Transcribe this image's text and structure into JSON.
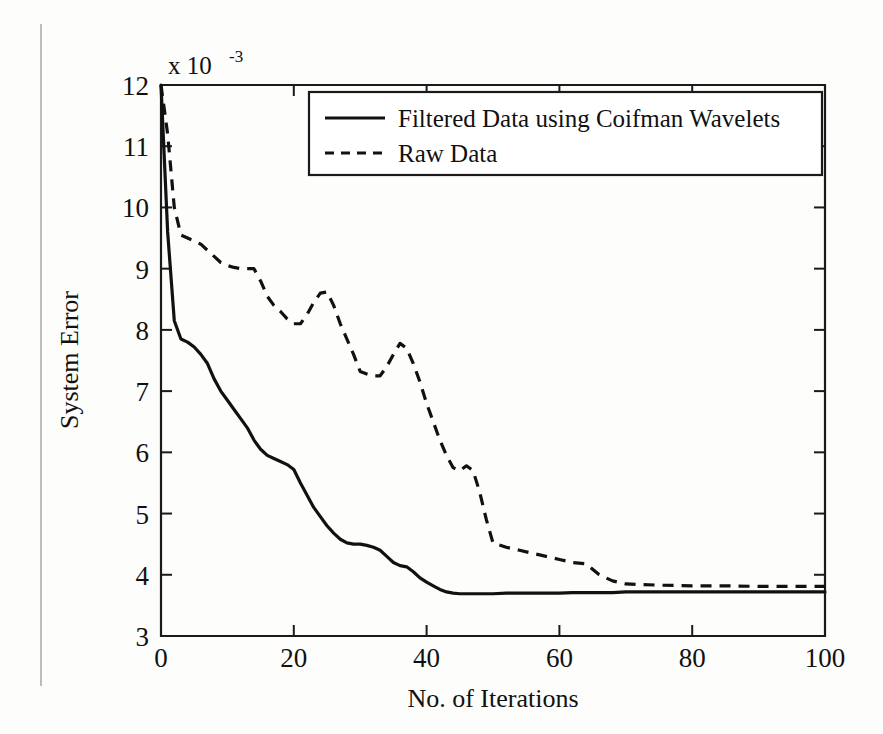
{
  "chart_data": {
    "type": "line",
    "title": "",
    "xlabel": "No. of Iterations",
    "ylabel": "System Error",
    "y_exponent_prefix": "x 10",
    "y_exponent_value": "-3",
    "xlim": [
      0,
      100
    ],
    "ylim": [
      3,
      12
    ],
    "xticks": [
      0,
      20,
      40,
      60,
      80,
      100
    ],
    "xticklabels": [
      "0",
      "20",
      "40",
      "60",
      "80",
      "100"
    ],
    "yticks": [
      3,
      4,
      5,
      6,
      7,
      8,
      9,
      10,
      11,
      12
    ],
    "yticklabels": [
      "3",
      "4",
      "5",
      "6",
      "7",
      "8",
      "9",
      "10",
      "11",
      "12"
    ],
    "grid": false,
    "legend_position": "top-right",
    "axis_color": "#111111",
    "series": [
      {
        "name": "Filtered Data using Coifman Wavelets",
        "style": "solid",
        "color": "#111111",
        "x": [
          0,
          1,
          2,
          3,
          4,
          5,
          6,
          7,
          8,
          9,
          10,
          11,
          12,
          13,
          14,
          15,
          16,
          17,
          18,
          19,
          20,
          21,
          22,
          23,
          24,
          25,
          26,
          27,
          28,
          29,
          30,
          31,
          32,
          33,
          34,
          35,
          36,
          37,
          38,
          39,
          40,
          41,
          42,
          43,
          44,
          45,
          46,
          48,
          50,
          52,
          54,
          56,
          58,
          60,
          62,
          64,
          66,
          68,
          70,
          75,
          80,
          85,
          90,
          95,
          100
        ],
        "y": [
          12.0,
          9.6,
          8.15,
          7.85,
          7.8,
          7.72,
          7.6,
          7.45,
          7.2,
          7.0,
          6.85,
          6.7,
          6.55,
          6.4,
          6.2,
          6.05,
          5.95,
          5.9,
          5.85,
          5.8,
          5.72,
          5.5,
          5.3,
          5.1,
          4.95,
          4.8,
          4.68,
          4.58,
          4.52,
          4.5,
          4.5,
          4.48,
          4.45,
          4.4,
          4.3,
          4.2,
          4.15,
          4.13,
          4.05,
          3.95,
          3.88,
          3.82,
          3.76,
          3.72,
          3.7,
          3.69,
          3.69,
          3.69,
          3.69,
          3.7,
          3.7,
          3.7,
          3.7,
          3.7,
          3.71,
          3.71,
          3.71,
          3.71,
          3.72,
          3.72,
          3.72,
          3.72,
          3.72,
          3.72,
          3.72
        ]
      },
      {
        "name": "Raw Data",
        "style": "dashed",
        "color": "#111111",
        "x": [
          0,
          1,
          2,
          3,
          4,
          5,
          6,
          7,
          8,
          9,
          10,
          11,
          12,
          13,
          14,
          15,
          16,
          17,
          18,
          19,
          20,
          21,
          22,
          23,
          24,
          25,
          26,
          27,
          28,
          29,
          30,
          31,
          32,
          33,
          34,
          35,
          36,
          37,
          38,
          39,
          40,
          41,
          42,
          43,
          44,
          45,
          46,
          47,
          48,
          49,
          50,
          52,
          54,
          56,
          58,
          60,
          62,
          64,
          66,
          68,
          70,
          75,
          80,
          85,
          90,
          95,
          100
        ],
        "y": [
          12.0,
          11.2,
          10.0,
          9.55,
          9.5,
          9.45,
          9.4,
          9.3,
          9.2,
          9.1,
          9.05,
          9.02,
          9.0,
          9.0,
          9.0,
          8.8,
          8.55,
          8.4,
          8.3,
          8.18,
          8.1,
          8.1,
          8.25,
          8.45,
          8.6,
          8.62,
          8.4,
          8.1,
          7.85,
          7.6,
          7.32,
          7.28,
          7.25,
          7.25,
          7.4,
          7.6,
          7.78,
          7.7,
          7.45,
          7.15,
          6.8,
          6.5,
          6.2,
          5.95,
          5.75,
          5.7,
          5.78,
          5.7,
          5.35,
          4.9,
          4.52,
          4.45,
          4.4,
          4.35,
          4.3,
          4.25,
          4.2,
          4.18,
          4.0,
          3.9,
          3.85,
          3.83,
          3.82,
          3.82,
          3.81,
          3.81,
          3.81
        ]
      }
    ]
  },
  "legend": {
    "entries": [
      {
        "label": "Filtered Data using Coifman Wavelets",
        "style": "solid"
      },
      {
        "label": "Raw Data",
        "style": "dashed"
      }
    ]
  }
}
